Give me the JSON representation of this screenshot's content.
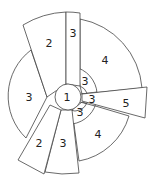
{
  "diagram": {
    "type": "sector-puzzle",
    "center": {
      "label": "1"
    },
    "regions": [
      {
        "id": "top-left-wedge",
        "label": "2"
      },
      {
        "id": "top-vertical-wedge",
        "label": "3"
      },
      {
        "id": "top-right-sector",
        "label": "4"
      },
      {
        "id": "inner-upper-right",
        "label": "3"
      },
      {
        "id": "inner-right",
        "label": "3"
      },
      {
        "id": "inner-lower-right",
        "label": "3"
      },
      {
        "id": "right-wedge",
        "label": "5"
      },
      {
        "id": "bottom-right-sector",
        "label": "4"
      },
      {
        "id": "bottom-wedge",
        "label": "3"
      },
      {
        "id": "bottom-left-wedge",
        "label": "2"
      },
      {
        "id": "left-sector",
        "label": "3"
      }
    ],
    "stroke_color": "#444444",
    "fill_color": "#ffffff"
  }
}
